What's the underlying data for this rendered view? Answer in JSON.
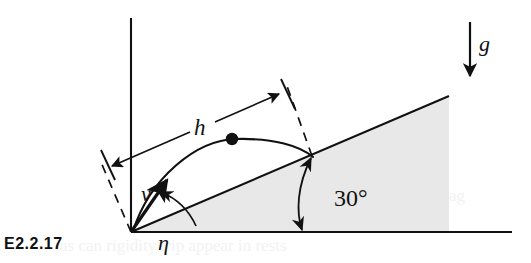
{
  "figure": {
    "id_label": "E2.2.17",
    "background_color": "#ffffff",
    "ink_color": "#111111",
    "wedge_fill_color": "#e8e8e8"
  },
  "labels": {
    "gravity": "g",
    "height_dimension": "h",
    "velocity": "v",
    "incline_angle": "30°",
    "launch_angle": "η"
  },
  "geometry": {
    "origin": {
      "x": 131,
      "y": 232
    },
    "vertical_axis": {
      "x": 131,
      "y_top": 18,
      "y_bottom": 232
    },
    "ground_line": {
      "x_start": 131,
      "x_end": 512,
      "y": 232
    },
    "incline_line": {
      "x_start": 131,
      "y_start": 232,
      "x_end": 449,
      "y_end": 96
    },
    "incline_angle_degrees": 30,
    "landing_point": {
      "x": 312,
      "y": 155
    },
    "apex_dot": {
      "x": 232,
      "y": 138
    },
    "velocity_arrow": {
      "x_start": 131,
      "y_start": 232,
      "x_end": 167,
      "y_end": 180
    },
    "gravity_arrow": {
      "x": 470,
      "y_top": 22,
      "y_bottom": 74
    },
    "dimension_line": {
      "x_start": 110,
      "y_start": 166,
      "x_end": 281,
      "y_end": 93
    }
  },
  "ghost_text": {
    "line_upper": "flew (7) flag",
    "line_lower": "as can rigidity trip appear in rests"
  }
}
